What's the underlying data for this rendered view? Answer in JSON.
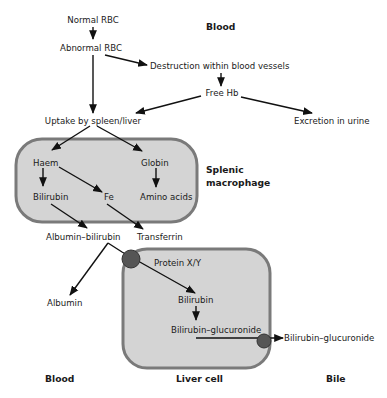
{
  "diagram": {
    "colors": {
      "cell_fill": "#d4d4d4",
      "cell_stroke": "#7a7a7a",
      "transporter": "#555555",
      "line": "#111111"
    },
    "regions": {
      "blood_top": "Blood",
      "splenic_line1": "Splenic",
      "splenic_line2": "macrophage",
      "blood_bottom": "Blood",
      "liver_cell": "Liver cell",
      "bile": "Bile"
    },
    "nodes": {
      "normal_rbc": "Normal RBC",
      "abnormal_rbc": "Abnormal RBC",
      "destruction": "Destruction within blood vessels",
      "free_hb": "Free Hb",
      "uptake": "Uptake by spleen/liver",
      "excretion_urine": "Excretion in urine",
      "haem": "Haem",
      "globin": "Globin",
      "bilirubin_mac": "Bilirubin",
      "fe": "Fe",
      "amino_acids": "Amino acids",
      "albumin_bilirubin": "Albumin–bilirubin",
      "transferrin": "Transferrin",
      "albumin": "Albumin",
      "protein_xy": "Protein X/Y",
      "bilirubin_liver": "Bilirubin",
      "bilirubin_glucuronide_liver": "Bilirubin–glucuronide",
      "bilirubin_glucuronide_bile": "Bilirubin–glucuronide"
    },
    "edges": [
      {
        "from": "Normal RBC",
        "to": "Abnormal RBC"
      },
      {
        "from": "Abnormal RBC",
        "to": "Destruction within blood vessels"
      },
      {
        "from": "Abnormal RBC",
        "to": "Uptake by spleen/liver"
      },
      {
        "from": "Destruction within blood vessels",
        "to": "Free Hb"
      },
      {
        "from": "Free Hb",
        "to": "Uptake by spleen/liver"
      },
      {
        "from": "Free Hb",
        "to": "Excretion in urine"
      },
      {
        "from": "Uptake by spleen/liver",
        "to": "Haem"
      },
      {
        "from": "Uptake by spleen/liver",
        "to": "Globin"
      },
      {
        "from": "Haem",
        "to": "Bilirubin"
      },
      {
        "from": "Haem",
        "to": "Fe"
      },
      {
        "from": "Globin",
        "to": "Amino acids"
      },
      {
        "from": "Bilirubin",
        "to": "Albumin–bilirubin"
      },
      {
        "from": "Fe",
        "to": "Transferrin"
      },
      {
        "from": "Albumin–bilirubin",
        "to": "Albumin"
      },
      {
        "from": "Albumin–bilirubin",
        "to": "Bilirubin (liver)",
        "via": "Protein X/Y"
      },
      {
        "from": "Bilirubin (liver)",
        "to": "Bilirubin–glucuronide"
      },
      {
        "from": "Bilirubin–glucuronide (liver)",
        "to": "Bilirubin–glucuronide (bile)"
      }
    ]
  }
}
